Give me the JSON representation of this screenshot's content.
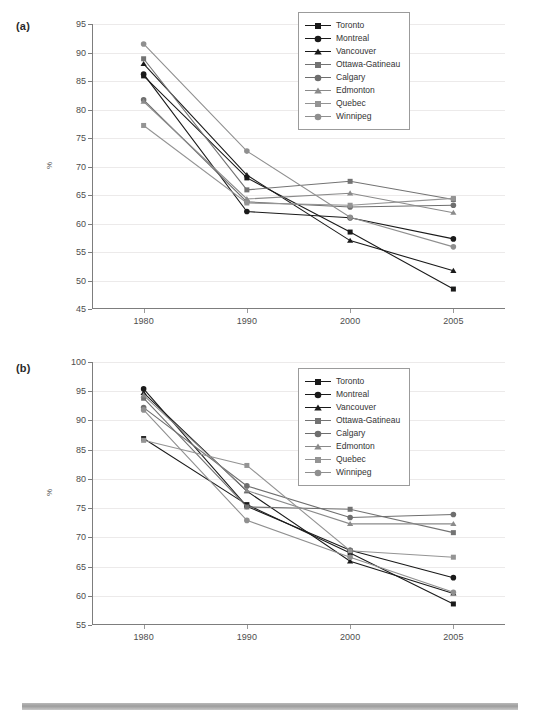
{
  "figure": {
    "panels": [
      {
        "id": "a",
        "label": "(a)"
      },
      {
        "id": "b",
        "label": "(b)"
      }
    ],
    "bottom_rule": "decorative-gray-bar"
  },
  "legend": {
    "position": "top-right",
    "entries": [
      {
        "label": "Toronto",
        "color": "#1a1a1a",
        "marker": "square"
      },
      {
        "label": "Montreal",
        "color": "#1a1a1a",
        "marker": "circle"
      },
      {
        "label": "Vancouver",
        "color": "#1a1a1a",
        "marker": "triangle"
      },
      {
        "label": "Ottawa-Gatineau",
        "color": "#737373",
        "marker": "square"
      },
      {
        "label": "Calgary",
        "color": "#6e6e6e",
        "marker": "circle"
      },
      {
        "label": "Edmonton",
        "color": "#8a8a8a",
        "marker": "triangle"
      },
      {
        "label": "Quebec",
        "color": "#949494",
        "marker": "square"
      },
      {
        "label": "Winnipeg",
        "color": "#8f8f8f",
        "marker": "circle"
      }
    ]
  },
  "chart_data": [
    {
      "panel": "a",
      "type": "line",
      "title": "",
      "xlabel": "",
      "ylabel": "%",
      "categories": [
        "1980",
        "1990",
        "2000",
        "2005"
      ],
      "ylim": [
        45,
        95
      ],
      "yticks": [
        45,
        50,
        55,
        60,
        65,
        70,
        75,
        80,
        85,
        90,
        95
      ],
      "grid": true,
      "legend_position": "top-right",
      "series": [
        {
          "name": "Toronto",
          "color": "#1a1a1a",
          "marker": "square",
          "values": [
            85.9,
            68.0,
            58.5,
            48.5
          ]
        },
        {
          "name": "Montreal",
          "color": "#1a1a1a",
          "marker": "circle",
          "values": [
            86.2,
            62.1,
            61.0,
            57.3
          ]
        },
        {
          "name": "Vancouver",
          "color": "#1a1a1a",
          "marker": "triangle",
          "values": [
            88.0,
            68.5,
            57.0,
            51.7
          ]
        },
        {
          "name": "Ottawa-Gatineau",
          "color": "#737373",
          "marker": "square",
          "values": [
            88.9,
            65.9,
            67.4,
            64.2
          ]
        },
        {
          "name": "Calgary",
          "color": "#6e6e6e",
          "marker": "circle",
          "values": [
            81.7,
            63.8,
            62.9,
            63.2
          ]
        },
        {
          "name": "Edmonton",
          "color": "#8a8a8a",
          "marker": "triangle",
          "values": [
            81.4,
            64.3,
            65.3,
            61.9
          ]
        },
        {
          "name": "Quebec",
          "color": "#949494",
          "marker": "square",
          "values": [
            77.2,
            63.6,
            63.2,
            64.4
          ]
        },
        {
          "name": "Winnipeg",
          "color": "#8f8f8f",
          "marker": "circle",
          "values": [
            91.5,
            72.7,
            61.1,
            55.9
          ]
        }
      ]
    },
    {
      "panel": "b",
      "type": "line",
      "title": "",
      "xlabel": "",
      "ylabel": "%",
      "categories": [
        "1980",
        "1990",
        "2000",
        "2005"
      ],
      "ylim": [
        55,
        100
      ],
      "yticks": [
        55,
        60,
        65,
        70,
        75,
        80,
        85,
        90,
        95,
        100
      ],
      "grid": true,
      "legend_position": "top-right",
      "series": [
        {
          "name": "Toronto",
          "color": "#1a1a1a",
          "marker": "square",
          "values": [
            86.9,
            75.6,
            67.3,
            58.6
          ]
        },
        {
          "name": "Montreal",
          "color": "#1a1a1a",
          "marker": "circle",
          "values": [
            95.4,
            75.3,
            67.8,
            63.1
          ]
        },
        {
          "name": "Vancouver",
          "color": "#1a1a1a",
          "marker": "triangle",
          "values": [
            94.7,
            77.9,
            65.9,
            60.4
          ]
        },
        {
          "name": "Ottawa-Gatineau",
          "color": "#737373",
          "marker": "square",
          "values": [
            93.8,
            75.2,
            74.8,
            70.8
          ]
        },
        {
          "name": "Calgary",
          "color": "#6e6e6e",
          "marker": "circle",
          "values": [
            92.2,
            78.8,
            73.4,
            73.9
          ]
        },
        {
          "name": "Edmonton",
          "color": "#8a8a8a",
          "marker": "triangle",
          "values": [
            94.3,
            78.0,
            72.3,
            72.3
          ]
        },
        {
          "name": "Quebec",
          "color": "#949494",
          "marker": "square",
          "values": [
            86.6,
            82.3,
            67.7,
            66.6
          ]
        },
        {
          "name": "Winnipeg",
          "color": "#8f8f8f",
          "marker": "circle",
          "values": [
            91.8,
            72.9,
            66.6,
            60.6
          ]
        }
      ]
    }
  ]
}
